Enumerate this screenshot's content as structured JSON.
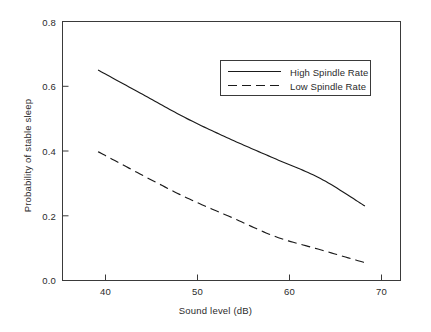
{
  "chart_data": {
    "type": "line",
    "title": "",
    "xlabel": "Sound level (dB)",
    "ylabel": "Probability of stable sleep",
    "xlim": [
      36,
      74
    ],
    "ylim": [
      0.0,
      0.8
    ],
    "xticks": [
      40,
      50,
      60,
      70
    ],
    "xtick_labels": [
      "40",
      "50",
      "60",
      "70"
    ],
    "yticks": [
      0.0,
      0.2,
      0.4,
      0.6,
      0.8
    ],
    "ytick_labels": [
      "0.0",
      "0.2",
      "0.4",
      "0.6",
      "0.8"
    ],
    "grid": false,
    "legend_position": "upper right",
    "x": [
      40,
      45,
      50,
      55,
      60,
      65,
      70
    ],
    "series": [
      {
        "name": "High Spindle Rate",
        "style": "solid",
        "color": "#1a1a1a",
        "values": [
          0.65,
          0.575,
          0.5,
          0.435,
          0.375,
          0.315,
          0.23
        ]
      },
      {
        "name": "Low Spindle Rate",
        "style": "dashed",
        "color": "#1a1a1a",
        "values": [
          0.398,
          0.325,
          0.255,
          0.195,
          0.135,
          0.095,
          0.055
        ]
      }
    ],
    "legend": [
      {
        "label": "High Spindle Rate",
        "style": "solid"
      },
      {
        "label": "Low Spindle Rate",
        "style": "dashed"
      }
    ]
  },
  "axes": {
    "x_title": "Sound level (dB)",
    "y_title": "Probability of stable sleep",
    "x_tick_0": "40",
    "x_tick_1": "50",
    "x_tick_2": "60",
    "x_tick_3": "70",
    "y_tick_0": "0.0",
    "y_tick_1": "0.2",
    "y_tick_2": "0.4",
    "y_tick_3": "0.6",
    "y_tick_4": "0.8"
  },
  "legend": {
    "entry_0_label": "High Spindle Rate",
    "entry_1_label": "Low Spindle Rate"
  },
  "colors": {
    "line": "#1a1a1a",
    "frame": "#3a3a3a",
    "background": "#ffffff"
  }
}
